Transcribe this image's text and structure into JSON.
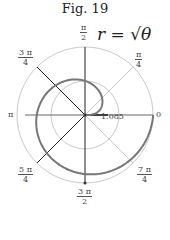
{
  "chart_data": {
    "type": "line",
    "subtype": "polar",
    "title": "Fig. 19",
    "equation": "r = √θ",
    "annotation": "1.085",
    "angle_labels": [
      {
        "angle": "0",
        "label": "0"
      },
      {
        "angle": "π/4",
        "num": "π",
        "den": "4"
      },
      {
        "angle": "π/2",
        "num": "π",
        "den": "2"
      },
      {
        "angle": "3π/4",
        "num": "3 π",
        "den": "4"
      },
      {
        "angle": "π",
        "label": "π"
      },
      {
        "angle": "5π/4",
        "num": "5 π",
        "den": "4"
      },
      {
        "angle": "3π/2",
        "num": "3 π",
        "den": "2"
      },
      {
        "angle": "7π/4",
        "num": "7 π",
        "den": "4"
      }
    ],
    "series": [
      {
        "name": "r = sqrt(theta)",
        "theta_range": [
          0,
          6.2832
        ],
        "r_formula": "sqrt(theta)"
      }
    ],
    "grid": {
      "circles": [
        1.25,
        2.5
      ],
      "rays_deg": [
        0,
        45,
        90,
        135,
        180,
        225,
        270,
        315
      ]
    }
  }
}
